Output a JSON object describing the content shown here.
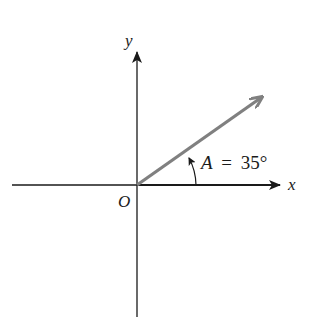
{
  "diagram": {
    "axes": {
      "x_label": "x",
      "y_label": "y",
      "origin_label": "O"
    },
    "vector": {
      "angle_deg": 35,
      "color": "#808080"
    },
    "angle_annotation": {
      "variable": "A",
      "equals": "=",
      "value": "35°",
      "text": "A = 35°"
    },
    "colors": {
      "axis": "#1a1a1a",
      "vector": "#808080"
    }
  }
}
